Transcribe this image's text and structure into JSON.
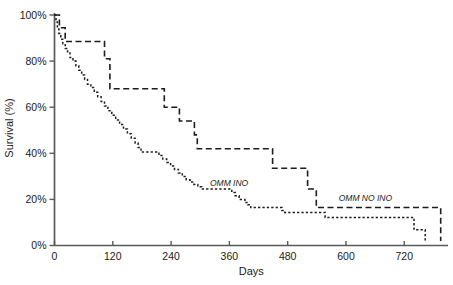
{
  "figure": {
    "background": "#ffffff",
    "curve_color": "#1c1c1c",
    "axis_color": "#595959",
    "text_color": "#1a1a1a"
  },
  "chart_data": {
    "type": "line",
    "subtype": "kaplan-meier-step",
    "title": "",
    "xlabel": "Days",
    "ylabel": "Survival (%)",
    "x_ticks": [
      0,
      120,
      240,
      360,
      480,
      600,
      720
    ],
    "y_ticks": [
      0,
      20,
      40,
      60,
      80,
      100
    ],
    "y_tick_suffix": "%",
    "xlim": [
      0,
      810
    ],
    "ylim": [
      0,
      100
    ],
    "grid": false,
    "legend_position": "inline-labels",
    "series": [
      {
        "name": "OMM NO INO",
        "dash": "long",
        "label": {
          "text": "OMM NO INO",
          "day": 585,
          "pct": 19.3
        },
        "points": [
          [
            0,
            100
          ],
          [
            10,
            94.5
          ],
          [
            22,
            88.5
          ],
          [
            103,
            81
          ],
          [
            114,
            68
          ],
          [
            226,
            60
          ],
          [
            257,
            54
          ],
          [
            288,
            48
          ],
          [
            294,
            42
          ],
          [
            449,
            33.5
          ],
          [
            521,
            24.5
          ],
          [
            539,
            16.5
          ],
          [
            795,
            2
          ]
        ]
      },
      {
        "name": "OMM INO",
        "dash": "short",
        "label": {
          "text": "OMM INO",
          "day": 320,
          "pct": 25.8
        },
        "points": [
          [
            0,
            100
          ],
          [
            3,
            97
          ],
          [
            6,
            94.5
          ],
          [
            9,
            92
          ],
          [
            13,
            89.5
          ],
          [
            17,
            87.5
          ],
          [
            22,
            85.5
          ],
          [
            27,
            83.5
          ],
          [
            32,
            81.5
          ],
          [
            38,
            80
          ],
          [
            44,
            78
          ],
          [
            50,
            76
          ],
          [
            56,
            74
          ],
          [
            62,
            72
          ],
          [
            68,
            70
          ],
          [
            75,
            68.5
          ],
          [
            82,
            66.5
          ],
          [
            89,
            64.5
          ],
          [
            96,
            62.5
          ],
          [
            103,
            60.5
          ],
          [
            110,
            58.5
          ],
          [
            118,
            56.5
          ],
          [
            126,
            54.5
          ],
          [
            134,
            52.5
          ],
          [
            142,
            50.5
          ],
          [
            150,
            48.5
          ],
          [
            158,
            46.5
          ],
          [
            166,
            44.5
          ],
          [
            172,
            42.5
          ],
          [
            178,
            40.5
          ],
          [
            215,
            39
          ],
          [
            223,
            37.5
          ],
          [
            231,
            36
          ],
          [
            239,
            34.5
          ],
          [
            247,
            33
          ],
          [
            255,
            31.5
          ],
          [
            263,
            30
          ],
          [
            271,
            28.5
          ],
          [
            279,
            27.5
          ],
          [
            287,
            26.5
          ],
          [
            295,
            25.5
          ],
          [
            303,
            24.5
          ],
          [
            365,
            23
          ],
          [
            372,
            21.6
          ],
          [
            380,
            20
          ],
          [
            392,
            18.6
          ],
          [
            398,
            17.7
          ],
          [
            404,
            16.5
          ],
          [
            468,
            15.2
          ],
          [
            474,
            14.3
          ],
          [
            557,
            12.2
          ],
          [
            740,
            6.8
          ],
          [
            763,
            1.5
          ]
        ]
      }
    ]
  }
}
